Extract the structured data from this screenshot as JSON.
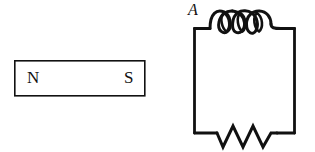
{
  "figure": {
    "background_color": "#ffffff",
    "stroke_color": "#111111",
    "width": 315,
    "height": 152
  },
  "magnet": {
    "name": "bar-magnet",
    "shape": "rectangle",
    "north_label": "N",
    "south_label": "S",
    "rect": {
      "x": 14,
      "y": 60,
      "width": 131,
      "height": 36
    },
    "stroke_width": 1.6
  },
  "circuit": {
    "name": "inductor-resistor-loop",
    "label": "A",
    "loop": {
      "x": 194,
      "y": 28,
      "width": 101,
      "height": 105
    },
    "stroke_width": 2.6,
    "inductor": {
      "name": "inductor-coil",
      "turns": 3,
      "position": "top",
      "lead_left_x": 210,
      "lead_right_x": 281
    },
    "resistor": {
      "name": "resistor-zigzag",
      "peaks": 3,
      "position": "bottom",
      "lead_left_x": 217,
      "lead_right_x": 277
    }
  }
}
